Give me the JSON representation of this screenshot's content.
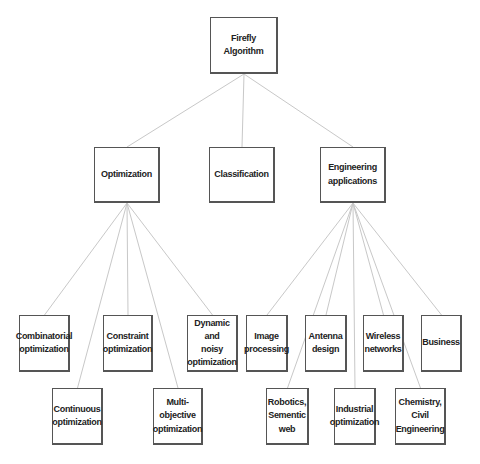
{
  "diagram": {
    "title": "Firefly Algorithm",
    "nodes": {
      "root": {
        "label": "Firefly Algorithm",
        "x": 210,
        "y": 17,
        "w": 68,
        "h": 57
      },
      "optimization": {
        "label": "Optimization",
        "x": 94,
        "y": 147,
        "w": 66,
        "h": 56
      },
      "classification": {
        "label": "Classification",
        "x": 209,
        "y": 147,
        "w": 66,
        "h": 56
      },
      "engineering": {
        "label": "Engineering\napplications",
        "x": 320,
        "y": 147,
        "w": 66,
        "h": 56
      },
      "combinatorial": {
        "label": "Combinatorial\noptimization",
        "x": 19,
        "y": 315,
        "w": 51,
        "h": 57
      },
      "constraint": {
        "label": "Constraint\noptimization",
        "x": 103,
        "y": 315,
        "w": 50,
        "h": 57
      },
      "dynamic": {
        "label": "Dynamic and\nnoisy\noptimization",
        "x": 187,
        "y": 315,
        "w": 51,
        "h": 57
      },
      "continuous": {
        "label": "Continuous\noptimization",
        "x": 52,
        "y": 388,
        "w": 51,
        "h": 57
      },
      "multiobjective": {
        "label": "Multi-objective\noptimization",
        "x": 153,
        "y": 388,
        "w": 50,
        "h": 57
      },
      "image": {
        "label": "Image\nprocessing",
        "x": 246,
        "y": 315,
        "w": 42,
        "h": 57
      },
      "antenna": {
        "label": "Antenna\ndesign",
        "x": 305,
        "y": 315,
        "w": 42,
        "h": 57
      },
      "wireless": {
        "label": "Wireless\nnetworks",
        "x": 363,
        "y": 315,
        "w": 41,
        "h": 57
      },
      "business": {
        "label": "Business",
        "x": 421,
        "y": 315,
        "w": 41,
        "h": 57
      },
      "robotics": {
        "label": "Robotics,\nSementic\nweb",
        "x": 266,
        "y": 388,
        "w": 43,
        "h": 57
      },
      "industrial": {
        "label": "Industrial\noptimization",
        "x": 334,
        "y": 388,
        "w": 42,
        "h": 57
      },
      "chemistry": {
        "label": "Chemistry,\nCivil\nEngineering",
        "x": 395,
        "y": 388,
        "w": 51,
        "h": 57
      }
    },
    "edges": [
      [
        "root",
        "optimization"
      ],
      [
        "root",
        "classification"
      ],
      [
        "root",
        "engineering"
      ],
      [
        "optimization",
        "combinatorial"
      ],
      [
        "optimization",
        "continuous"
      ],
      [
        "optimization",
        "constraint"
      ],
      [
        "optimization",
        "multiobjective"
      ],
      [
        "optimization",
        "dynamic"
      ],
      [
        "engineering",
        "image"
      ],
      [
        "engineering",
        "robotics"
      ],
      [
        "engineering",
        "antenna"
      ],
      [
        "engineering",
        "industrial"
      ],
      [
        "engineering",
        "wireless"
      ],
      [
        "engineering",
        "chemistry"
      ],
      [
        "engineering",
        "business"
      ]
    ],
    "colors": {
      "edge": "#c8c8c8",
      "border": "#555555",
      "text": "#222222"
    }
  }
}
